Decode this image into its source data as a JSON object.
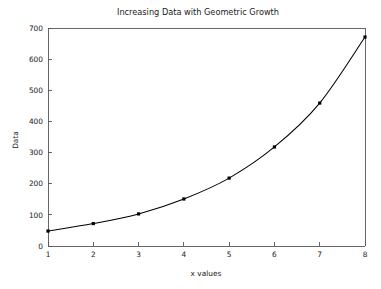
{
  "chart_data": {
    "type": "line",
    "title": "Increasing Data with Geometric Growth",
    "xlabel": "x values",
    "ylabel": "Data",
    "x": [
      1,
      2,
      3,
      4,
      5,
      6,
      7,
      8
    ],
    "values": [
      48,
      72,
      103,
      151,
      218,
      318,
      459,
      671
    ],
    "series": [
      {
        "name": "Data",
        "x": [
          1,
          2,
          3,
          4,
          5,
          6,
          7,
          8
        ],
        "values": [
          48,
          72,
          103,
          151,
          218,
          318,
          459,
          671
        ]
      }
    ],
    "xlim": [
      1,
      8
    ],
    "ylim": [
      0,
      700
    ],
    "xticks": [
      "1",
      "2",
      "3",
      "4",
      "5",
      "6",
      "7",
      "8"
    ],
    "yticks": [
      "0",
      "100",
      "200",
      "300",
      "400",
      "500",
      "600",
      "700"
    ],
    "grid": false,
    "legend": false,
    "marker": "square",
    "line_color": "#000000",
    "marker_color": "#000000",
    "axis_color": "#555555",
    "background_color": "#ffffff"
  }
}
